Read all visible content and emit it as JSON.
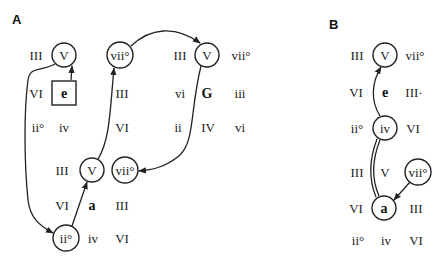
{
  "panels": {
    "A": {
      "label": "A",
      "grids": [
        {
          "key": "e",
          "rows": [
            [
              "III",
              "V",
              "vii°"
            ],
            [
              "VI",
              "e",
              "III"
            ],
            [
              "ii°",
              "iv",
              "VI"
            ]
          ]
        },
        {
          "key": "G",
          "rows": [
            [
              "III",
              "V",
              "vii°"
            ],
            [
              "vi",
              "G",
              "iii"
            ],
            [
              "ii",
              "IV",
              "vi"
            ]
          ]
        },
        {
          "key": "a",
          "rows": [
            [
              "III",
              "V",
              "vii°"
            ],
            [
              "VI",
              "a",
              "III"
            ],
            [
              "ii°",
              "iv",
              "VI"
            ]
          ]
        }
      ]
    },
    "B": {
      "label": "B",
      "grids": [
        {
          "key": "e",
          "rows": [
            [
              "III",
              "V",
              "vii°"
            ],
            [
              "VI",
              "e",
              "III·"
            ],
            [
              "ii°",
              "iv",
              "VI"
            ]
          ]
        },
        {
          "key": "a",
          "rows": [
            [
              "III",
              "V",
              "vii°"
            ],
            [
              "VI",
              "a",
              "III"
            ],
            [
              "ii°",
              "iv",
              "VI"
            ]
          ]
        }
      ]
    }
  }
}
